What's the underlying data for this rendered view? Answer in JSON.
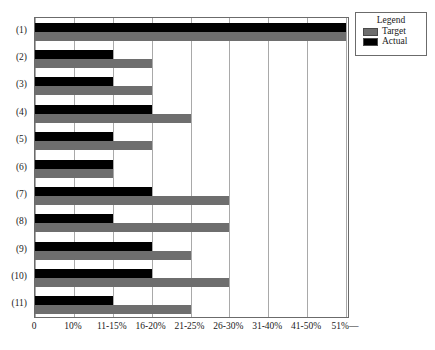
{
  "chart_data": {
    "type": "bar",
    "orientation": "horizontal",
    "title": "",
    "subtitle": "",
    "xlabel": "",
    "ylabel": "",
    "grid": true,
    "legend_position": "top-right",
    "categories": [
      "(1)",
      "(2)",
      "(3)",
      "(4)",
      "(5)",
      "(6)",
      "(7)",
      "(8)",
      "(9)",
      "(10)",
      "(11)"
    ],
    "x_tick_labels": [
      "0",
      "10%",
      "11-15%",
      "16-20%",
      "21-25%",
      "26-30%",
      "31-40%",
      "41-50%",
      "51%—"
    ],
    "x_tick_index": [
      0,
      1,
      2,
      3,
      4,
      5,
      6,
      7,
      8
    ],
    "xlim": [
      0,
      8
    ],
    "series": [
      {
        "name": "Target",
        "color": "#6e6e6e",
        "values": [
          8,
          3,
          3,
          4,
          3,
          2,
          5,
          5,
          4,
          5,
          4
        ],
        "value_labels": [
          "51%—",
          "16-20%",
          "16-20%",
          "21-25%",
          "16-20%",
          "11-15%",
          "26-30%",
          "26-30%",
          "21-25%",
          "26-30%",
          "21-25%"
        ]
      },
      {
        "name": "Actual",
        "color": "#000000",
        "values": [
          8,
          2,
          2,
          3,
          2,
          2,
          3,
          2,
          3,
          3,
          2
        ],
        "value_labels": [
          "51%—",
          "11-15%",
          "11-15%",
          "16-20%",
          "11-15%",
          "11-15%",
          "16-20%",
          "11-15%",
          "16-20%",
          "16-20%",
          "11-15%"
        ]
      }
    ]
  },
  "legend": {
    "title": "Legend",
    "items": [
      {
        "label": "Target",
        "color": "#6e6e6e"
      },
      {
        "label": "Actual",
        "color": "#000000"
      }
    ]
  }
}
